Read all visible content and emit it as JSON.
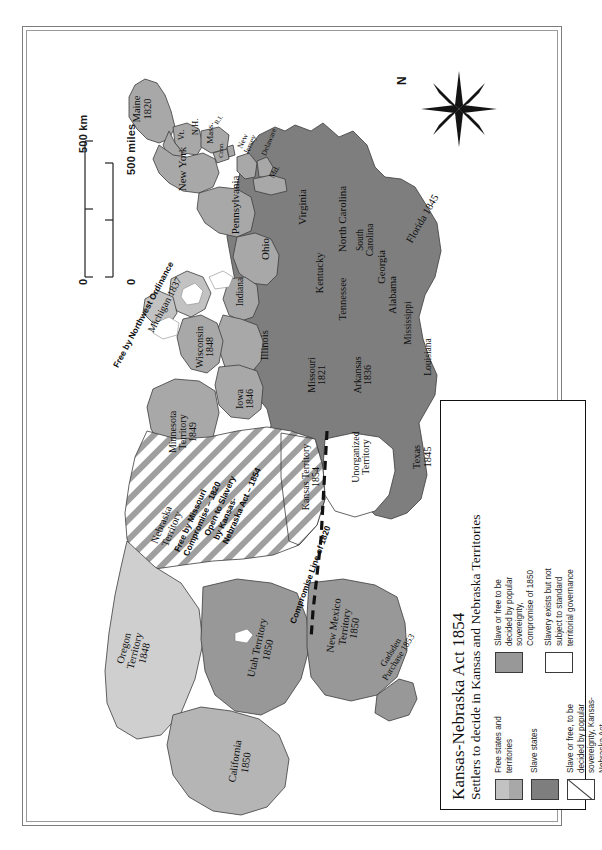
{
  "legend": {
    "title": "Kansas-Nebraska Act 1854",
    "subtitle": "Settlers to decide in Kansas and Nebraska Territories",
    "entries": [
      {
        "swatch": "free-states-swatch",
        "style": "split-light-gray",
        "label": "Free states and territories"
      },
      {
        "swatch": "slave-states-swatch",
        "style": "dark-gray",
        "label": "Slave states"
      },
      {
        "swatch": "popular-sovereignty-swatch",
        "style": "diagonal-hatch",
        "label": "Slave or free, to be decided by popular sovereignty, Kansas-Nebraska Act"
      },
      {
        "swatch": "compromise-1850-swatch",
        "style": "mid-gray",
        "label": "Slave or free to be decided by popular sovereignty, Compromise of 1850"
      },
      {
        "swatch": "unorganized-swatch",
        "style": "white",
        "label": "Slavery exists but not subject to standard territorial governance"
      }
    ]
  },
  "colors": {
    "slave": "#7e7e7e",
    "free": "#a8a8a8",
    "free_light": "#c2c2c2",
    "compromise": "#989898",
    "california": "#b5b5b5",
    "oregon": "#cfcfcf",
    "unorganized": "#ffffff",
    "outline": "#3c3c3c",
    "ink": "#0d0d0d"
  },
  "scale": {
    "km_label": "500 km",
    "miles_label": "500 miles",
    "zero_km": "0",
    "zero_miles": "0"
  },
  "compass": {
    "north_label": "N",
    "icon": "compass-star-icon"
  },
  "places": [
    {
      "name": "Maine 1820",
      "lines": [
        "Maine",
        "1820"
      ],
      "x": 120,
      "y": 82,
      "rot": -90,
      "size": 10.5
    },
    {
      "name": "Vermont",
      "lines": [
        "Vt."
      ],
      "x": 158,
      "y": 108,
      "rot": -90,
      "size": 8.5
    },
    {
      "name": "New Hampshire",
      "lines": [
        "N.H."
      ],
      "x": 172,
      "y": 100,
      "rot": -90,
      "size": 8.5
    },
    {
      "name": "Massachusetts",
      "lines": [
        "Mass."
      ],
      "x": 188,
      "y": 106,
      "rot": -90,
      "size": 9
    },
    {
      "name": "Connecticut",
      "lines": [
        "Conn."
      ],
      "x": 198,
      "y": 123,
      "rot": -90,
      "size": 6.5
    },
    {
      "name": "Rhode Island",
      "lines": [
        "R.I."
      ],
      "x": 196,
      "y": 93,
      "rot": -58,
      "size": 6.5
    },
    {
      "name": "New York",
      "lines": [
        "New York"
      ],
      "x": 160,
      "y": 142,
      "rot": -90,
      "size": 11
    },
    {
      "name": "Pennsylvania",
      "lines": [
        "Pennsylvania"
      ],
      "x": 213,
      "y": 178,
      "rot": -90,
      "size": 11
    },
    {
      "name": "New Jersey",
      "lines": [
        "New",
        "Jersey"
      ],
      "x": 224,
      "y": 116,
      "rot": -65,
      "size": 8
    },
    {
      "name": "Delaware",
      "lines": [
        "Delaware"
      ],
      "x": 246,
      "y": 115,
      "rot": -68,
      "size": 7.5
    },
    {
      "name": "Maryland",
      "lines": [
        "Md."
      ],
      "x": 252,
      "y": 145,
      "rot": -62,
      "size": 8
    },
    {
      "name": "Ohio",
      "lines": [
        "Ohio"
      ],
      "x": 243,
      "y": 222,
      "rot": -90,
      "size": 11
    },
    {
      "name": "Indiana",
      "lines": [
        "Indiana"
      ],
      "x": 218,
      "y": 265,
      "rot": -90,
      "size": 9.5
    },
    {
      "name": "Illinois",
      "lines": [
        "Illinois"
      ],
      "x": 242,
      "y": 318,
      "rot": -90,
      "size": 10.5
    },
    {
      "name": "Michigan 1837",
      "lines": [
        "Michigan 1837"
      ],
      "x": 142,
      "y": 278,
      "rot": -62,
      "size": 10
    },
    {
      "name": "Wisconsin",
      "lines": [
        "Wisconsin",
        "1848"
      ],
      "x": 182,
      "y": 320,
      "rot": -90,
      "size": 10
    },
    {
      "name": "Iowa",
      "lines": [
        "Iowa",
        "1846"
      ],
      "x": 222,
      "y": 372,
      "rot": -90,
      "size": 10
    },
    {
      "name": "Minnesota Territory",
      "lines": [
        "Minnesota",
        "Territory",
        "1849"
      ],
      "x": 160,
      "y": 405,
      "rot": -90,
      "size": 10
    },
    {
      "name": "Virginia",
      "lines": [
        "Virginia"
      ],
      "x": 280,
      "y": 180,
      "rot": -90,
      "size": 11
    },
    {
      "name": "North Carolina",
      "lines": [
        "North Carolina"
      ],
      "x": 320,
      "y": 192,
      "rot": -90,
      "size": 11
    },
    {
      "name": "South Carolina",
      "lines": [
        "South",
        "Carolina"
      ],
      "x": 343,
      "y": 213,
      "rot": -90,
      "size": 9.5
    },
    {
      "name": "Georgia",
      "lines": [
        "Georgia"
      ],
      "x": 359,
      "y": 240,
      "rot": -90,
      "size": 10.5
    },
    {
      "name": "Alabama",
      "lines": [
        "Alabama"
      ],
      "x": 370,
      "y": 268,
      "rot": -90,
      "size": 10.5
    },
    {
      "name": "Mississippi",
      "lines": [
        "Mississippi"
      ],
      "x": 386,
      "y": 296,
      "rot": -90,
      "size": 9.5
    },
    {
      "name": "Louisiana",
      "lines": [
        "Louisiana"
      ],
      "x": 406,
      "y": 330,
      "rot": -90,
      "size": 9.5
    },
    {
      "name": "Florida 1845",
      "lines": [
        "Florida 1845"
      ],
      "x": 400,
      "y": 192,
      "rot": -60,
      "size": 10.5
    },
    {
      "name": "Kentucky",
      "lines": [
        "Kentucky"
      ],
      "x": 297,
      "y": 246,
      "rot": -90,
      "size": 10.5
    },
    {
      "name": "Tennessee",
      "lines": [
        "Tennessee"
      ],
      "x": 320,
      "y": 272,
      "rot": -90,
      "size": 10.5
    },
    {
      "name": "Missouri",
      "lines": [
        "Missouri",
        "1821"
      ],
      "x": 294,
      "y": 348,
      "rot": -90,
      "size": 10
    },
    {
      "name": "Arkansas",
      "lines": [
        "Arkansas",
        "1836"
      ],
      "x": 340,
      "y": 348,
      "rot": -90,
      "size": 10
    },
    {
      "name": "Texas",
      "lines": [
        "Texas",
        "1845"
      ],
      "x": 400,
      "y": 430,
      "rot": -90,
      "size": 10.5
    },
    {
      "name": "Unorganized Territory",
      "lines": [
        "Unorganized",
        "Territory"
      ],
      "x": 338,
      "y": 430,
      "rot": -90,
      "size": 10
    },
    {
      "name": "Kansas Territory",
      "lines": [
        "Kansas Territory",
        "1854"
      ],
      "x": 288,
      "y": 450,
      "rot": -90,
      "size": 10
    },
    {
      "name": "Nebraska Territory",
      "lines": [
        "Nebraska",
        "Territory"
      ],
      "x": 144,
      "y": 500,
      "rot": -68,
      "size": 10.5
    },
    {
      "name": "Oregon Territory",
      "lines": [
        "Oregon",
        "Territory",
        "1848"
      ],
      "x": 112,
      "y": 624,
      "rot": -76,
      "size": 10.5
    },
    {
      "name": "Utah Territory",
      "lines": [
        "Utah Territory",
        "1850"
      ],
      "x": 240,
      "y": 622,
      "rot": -78,
      "size": 10.5
    },
    {
      "name": "New Mexico Territory",
      "lines": [
        "New Mexico",
        "Territory",
        "1850"
      ],
      "x": 322,
      "y": 600,
      "rot": -82,
      "size": 10.5
    },
    {
      "name": "California",
      "lines": [
        "California",
        "1850"
      ],
      "x": 218,
      "y": 735,
      "rot": -82,
      "size": 10.5
    },
    {
      "name": "Gadsden Purchase",
      "lines": [
        "Gadsden",
        "Purchase 1853"
      ],
      "x": 372,
      "y": 628,
      "rot": -58,
      "size": 9
    }
  ],
  "annotations": [
    {
      "name": "northwest-ordinance-note",
      "lines": [
        "Free by Northwest Ordinance"
      ],
      "x": 121,
      "y": 288,
      "rot": -62,
      "size": 8.5
    },
    {
      "name": "missouri-compromise-note",
      "lines": [
        "Free by Missouri",
        "Compromise – 1820"
      ],
      "x": 175,
      "y": 490,
      "rot": -66,
      "size": 8.5
    },
    {
      "name": "kansas-nebraska-note",
      "lines": [
        "Open to Slavery",
        "by Kansas-",
        "Nebraska Act – 1854"
      ],
      "x": 210,
      "y": 475,
      "rot": -66,
      "size": 8.5
    },
    {
      "name": "compromise-line-note",
      "lines": [
        "Compromise Line of 1820"
      ],
      "x": 288,
      "y": 548,
      "rot": -70,
      "size": 8.5
    }
  ]
}
